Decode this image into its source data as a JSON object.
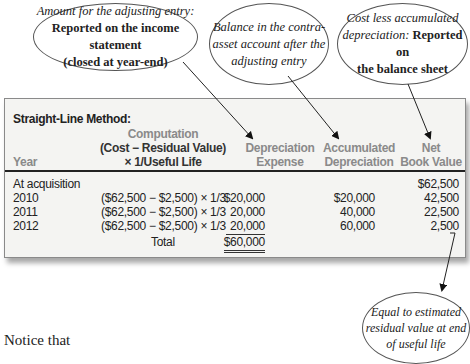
{
  "callouts": {
    "income": {
      "line1": "Amount for the adjusting entry:",
      "line2": "Reported on the income statement",
      "line3": "(closed at year-end)"
    },
    "contra": {
      "line1": "Balance in the contra-",
      "line2": "asset account after the",
      "line3": "adjusting entry"
    },
    "balance": {
      "line1a": "Cost less accumulated",
      "line2a": "depreciation:",
      "line2b": " Reported on",
      "line3": "the balance sheet"
    },
    "residual": {
      "line1": "Equal to estimated",
      "line2": "residual value at end",
      "line3": "of useful life"
    }
  },
  "table": {
    "title": "Straight-Line Method:",
    "headers": {
      "year": "Year",
      "computation_1": "Computation",
      "computation_2": "(Cost − Residual Value)",
      "computation_3": "× 1/Useful Life",
      "dep_exp_1": "Depreciation",
      "dep_exp_2": "Expense",
      "acc_dep_1": "Accumulated",
      "acc_dep_2": "Depreciation",
      "nbv_1": "Net",
      "nbv_2": "Book Value"
    },
    "rows": [
      {
        "year": "At acquisition",
        "computation": "",
        "dep_exp": "",
        "acc_dep": "",
        "nbv": "$62,500"
      },
      {
        "year": "2010",
        "computation": "($62,500 − $2,500) × 1/3",
        "dep_exp": "$20,000",
        "acc_dep": "$20,000",
        "nbv": "42,500"
      },
      {
        "year": "2011",
        "computation": "($62,500 − $2,500) × 1/3",
        "dep_exp": "20,000",
        "acc_dep": "40,000",
        "nbv": "22,500"
      },
      {
        "year": "2012",
        "computation": "($62,500 − $2,500) × 1/3",
        "dep_exp": "20,000",
        "acc_dep": "60,000",
        "nbv": "2,500"
      }
    ],
    "total_label": "Total",
    "total_value": "$60,000"
  },
  "body_text": "Notice that",
  "colors": {
    "panel_bg": "#f4f4f2",
    "header_gray": "#8a8a8a",
    "text": "#222222"
  }
}
